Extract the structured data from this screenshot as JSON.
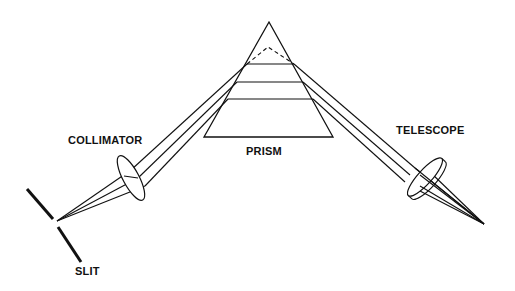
{
  "diagram": {
    "type": "prism spectrometer optical layout",
    "labels": {
      "collimator": "COLLIMATOR",
      "prism": "PRISM",
      "telescope": "TELESCOPE",
      "slit": "SLIT"
    },
    "colors": {
      "line": "#111111",
      "background": "#ffffff"
    }
  }
}
